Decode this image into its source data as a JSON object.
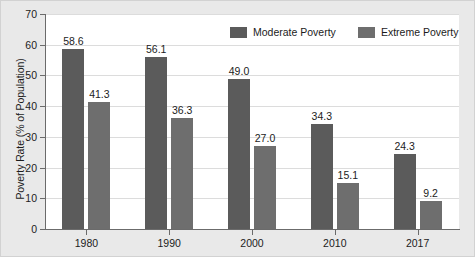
{
  "chart_data": {
    "type": "bar",
    "title": "",
    "xlabel": "",
    "ylabel": "Poverty Rate (% of Population)",
    "categories": [
      "1980",
      "1990",
      "2000",
      "2010",
      "2017"
    ],
    "series": [
      {
        "name": "Moderate Poverty",
        "color": "#5b5b5b",
        "values": [
          58.6,
          56.1,
          49.0,
          34.3,
          24.3
        ],
        "labels": [
          "58.6",
          "56.1",
          "49.0",
          "34.3",
          "24.3"
        ]
      },
      {
        "name": "Extreme Poverty",
        "color": "#6e6e6e",
        "values": [
          41.3,
          36.3,
          27.0,
          15.1,
          9.2
        ],
        "labels": [
          "41.3",
          "36.3",
          "27.0",
          "15.1",
          "9.2"
        ]
      }
    ],
    "ylim": [
      0,
      70
    ],
    "yticks": [
      0,
      10,
      20,
      30,
      40,
      50,
      60,
      70
    ],
    "ytick_labels": [
      "0",
      "10",
      "20",
      "30",
      "40",
      "50",
      "60",
      "70"
    ],
    "grid": true,
    "legend_position": "top-center"
  },
  "legend": {
    "items": [
      {
        "label": "Moderate Poverty",
        "swatch": "moderate-swatch"
      },
      {
        "label": "Extreme Poverty",
        "swatch": "extreme-swatch"
      }
    ]
  },
  "colors": {
    "moderate": "#5b5b5b",
    "extreme": "#6e6e6e",
    "plot_background": "#ffffff",
    "figure_background": "#e9e9e9",
    "grid": "#dcdcdc",
    "axis": "#6b6b6b",
    "text": "#1c1c1c"
  }
}
